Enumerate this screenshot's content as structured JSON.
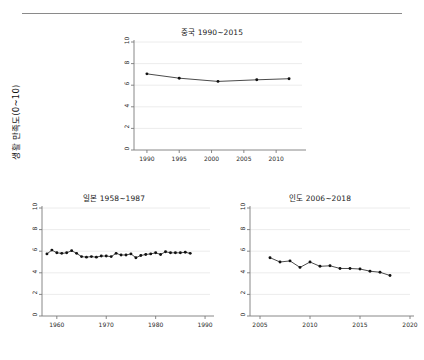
{
  "figure": {
    "ylabel": "생활 만족도(0~10)",
    "divider": "horizontal-rule"
  },
  "chart_data": [
    {
      "type": "line",
      "id": "china",
      "title": "중국 1990~2015",
      "xlabel": "",
      "ylabel": "생활 만족도(0~10)",
      "xlim": [
        1988,
        2014
      ],
      "ylim": [
        0,
        10
      ],
      "xticks": [
        1990,
        1995,
        2000,
        2005,
        2010
      ],
      "xtick_labels": [
        "1990",
        "1995",
        "2000",
        "2005",
        "2010"
      ],
      "yticks": [
        0,
        2,
        4,
        6,
        8,
        10
      ],
      "ytick_labels": [
        "0",
        "2",
        "4",
        "6",
        "8",
        "10"
      ],
      "grid": "horizontal",
      "legend": "none",
      "marker": "filled-circle",
      "x": [
        1990,
        1995,
        2001,
        2007,
        2012
      ],
      "values": [
        7.05,
        6.65,
        6.35,
        6.5,
        6.6
      ]
    },
    {
      "type": "line",
      "id": "japan",
      "title": "일본 1958~1987",
      "xlabel": "",
      "ylabel": "생활 만족도(0~10)",
      "xlim": [
        1957,
        1991
      ],
      "ylim": [
        0,
        10
      ],
      "xticks": [
        1960,
        1970,
        1980,
        1990
      ],
      "xtick_labels": [
        "1960",
        "1970",
        "1980",
        "1990"
      ],
      "yticks": [
        0,
        2,
        4,
        6,
        8,
        10
      ],
      "ytick_labels": [
        "0",
        "2",
        "4",
        "6",
        "8",
        "10"
      ],
      "grid": "horizontal",
      "legend": "none",
      "marker": "filled-circle",
      "x": [
        1958,
        1959,
        1960,
        1961,
        1962,
        1963,
        1964,
        1965,
        1966,
        1967,
        1968,
        1969,
        1970,
        1971,
        1972,
        1973,
        1974,
        1975,
        1976,
        1977,
        1978,
        1979,
        1980,
        1981,
        1982,
        1983,
        1984,
        1985,
        1986,
        1987
      ],
      "values": [
        5.75,
        6.1,
        5.85,
        5.8,
        5.85,
        6.05,
        5.8,
        5.5,
        5.45,
        5.5,
        5.45,
        5.55,
        5.55,
        5.5,
        5.8,
        5.65,
        5.65,
        5.75,
        5.4,
        5.6,
        5.7,
        5.75,
        5.85,
        5.7,
        5.95,
        5.85,
        5.85,
        5.85,
        5.9,
        5.8
      ]
    },
    {
      "type": "line",
      "id": "india",
      "title": "인도 2006~2018",
      "xlabel": "",
      "ylabel": "생활 만족도(0~10)",
      "xlim": [
        2004,
        2020
      ],
      "ylim": [
        0,
        10
      ],
      "xticks": [
        2005,
        2010,
        2015,
        2020
      ],
      "xtick_labels": [
        "2005",
        "2010",
        "2015",
        "2020"
      ],
      "yticks": [
        0,
        2,
        4,
        6,
        8,
        10
      ],
      "ytick_labels": [
        "0",
        "2",
        "4",
        "6",
        "8",
        "10"
      ],
      "grid": "horizontal",
      "legend": "none",
      "marker": "filled-circle",
      "x": [
        2006,
        2007,
        2008,
        2009,
        2010,
        2011,
        2012,
        2013,
        2014,
        2015,
        2016,
        2017,
        2018
      ],
      "values": [
        5.4,
        5.0,
        5.1,
        4.5,
        5.0,
        4.6,
        4.65,
        4.4,
        4.4,
        4.35,
        4.15,
        4.05,
        3.75
      ]
    }
  ]
}
